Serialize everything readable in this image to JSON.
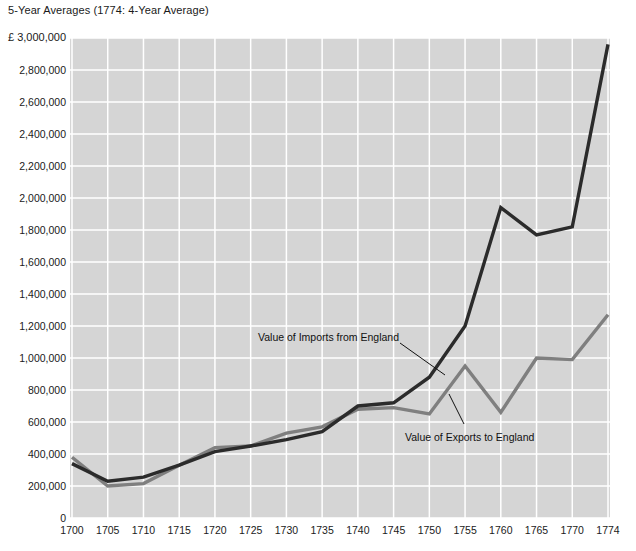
{
  "chart_data": {
    "type": "line",
    "title": "5-Year Averages (1774: 4-Year Average)",
    "unit_label": "£ 3,000,000",
    "currency_symbol": "£",
    "xlabel": "",
    "ylabel": "",
    "grid": true,
    "legend_position": "inline-annotations",
    "xlim": [
      1700,
      1774
    ],
    "ylim": [
      0,
      3000000
    ],
    "x": [
      1700,
      1705,
      1710,
      1715,
      1720,
      1725,
      1730,
      1735,
      1740,
      1745,
      1750,
      1755,
      1760,
      1765,
      1770,
      1774
    ],
    "categories": [
      "1700",
      "1705",
      "1710",
      "1715",
      "1720",
      "1725",
      "1730",
      "1735",
      "1740",
      "1745",
      "1750",
      "1755",
      "1760",
      "1765",
      "1770",
      "1774"
    ],
    "ytick_values": [
      0,
      200000,
      400000,
      600000,
      800000,
      1000000,
      1200000,
      1400000,
      1600000,
      1800000,
      2000000,
      2200000,
      2400000,
      2600000,
      2800000,
      3000000
    ],
    "ytick_labels": [
      "0",
      "200,000",
      "400,000",
      "600,000",
      "800,000",
      "1,000,000",
      "1,200,000",
      "1,400,000",
      "1,600,000",
      "1,800,000",
      "2,000,000",
      "2,200,000",
      "2,400,000",
      "2,600,000",
      "2,800,000",
      "£ 3,000,000"
    ],
    "series": [
      {
        "name": "Value of Imports from England",
        "color": "#2b2b2b",
        "width": 3.4,
        "values": [
          340000,
          230000,
          255000,
          330000,
          415000,
          450000,
          490000,
          540000,
          700000,
          720000,
          880000,
          1200000,
          1940000,
          1770000,
          1820000,
          2960000
        ]
      },
      {
        "name": "Value of Exports to England",
        "color": "#7f7f7f",
        "width": 3.4,
        "values": [
          380000,
          200000,
          215000,
          330000,
          440000,
          450000,
          530000,
          570000,
          680000,
          690000,
          650000,
          950000,
          660000,
          1000000,
          990000,
          1270000
        ]
      }
    ],
    "annotations": [
      {
        "text": "Value of Imports from England",
        "series": "Value of Imports from England",
        "leader_from": [
          400,
          343
        ],
        "leader_to": [
          445,
          375
        ]
      },
      {
        "text": "Value of Exports to England",
        "series": "Value of Exports to England",
        "leader_from": [
          464,
          424
        ],
        "leader_to": [
          449,
          394
        ]
      }
    ],
    "style": {
      "plot_background": "#d5d5d5",
      "gridline_color": "#ffffff",
      "page_background": "#ffffff",
      "text_color": "#1a1a1a"
    }
  }
}
